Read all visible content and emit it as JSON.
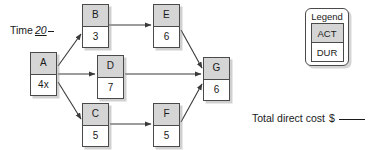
{
  "diagram": {
    "type": "activity-on-node-network",
    "time_annotation": {
      "label": "Time",
      "value": "20"
    },
    "nodes": [
      {
        "id": "A",
        "activity": "A",
        "duration": "4x",
        "x": 30,
        "y": 52
      },
      {
        "id": "B",
        "activity": "B",
        "duration": "3",
        "x": 82,
        "y": 4
      },
      {
        "id": "C",
        "activity": "C",
        "duration": "5",
        "x": 82,
        "y": 103
      },
      {
        "id": "D",
        "activity": "D",
        "duration": "7",
        "x": 97,
        "y": 55
      },
      {
        "id": "E",
        "activity": "E",
        "duration": "6",
        "x": 153,
        "y": 4
      },
      {
        "id": "F",
        "activity": "F",
        "duration": "5",
        "x": 153,
        "y": 103
      },
      {
        "id": "G",
        "activity": "G",
        "duration": "6",
        "x": 203,
        "y": 57
      }
    ],
    "edges": [
      {
        "from": "A",
        "to": "B",
        "x1": 58,
        "y1": 66,
        "x2": 81,
        "y2": 34
      },
      {
        "from": "A",
        "to": "D",
        "x1": 58,
        "y1": 74,
        "x2": 95,
        "y2": 74
      },
      {
        "from": "A",
        "to": "C",
        "x1": 58,
        "y1": 82,
        "x2": 81,
        "y2": 119
      },
      {
        "from": "B",
        "to": "E",
        "x1": 109,
        "y1": 25,
        "x2": 151,
        "y2": 25
      },
      {
        "from": "C",
        "to": "F",
        "x1": 110,
        "y1": 124,
        "x2": 151,
        "y2": 124
      },
      {
        "from": "E",
        "to": "G",
        "x1": 181,
        "y1": 30,
        "x2": 202,
        "y2": 68
      },
      {
        "from": "D",
        "to": "G",
        "x1": 125,
        "y1": 74,
        "x2": 201,
        "y2": 74
      },
      {
        "from": "F",
        "to": "G",
        "x1": 181,
        "y1": 122,
        "x2": 202,
        "y2": 84
      }
    ],
    "colors": {
      "activity_cell_fill": "#d5d5d5",
      "duration_cell_fill": "#ffffff",
      "border": "#4a4a4a",
      "text": "#1a1a1a",
      "background": "#ffffff"
    }
  },
  "legend": {
    "title": "Legend",
    "activity_label": "ACT",
    "duration_label": "DUR"
  },
  "total_cost": {
    "label": "Total direct cost",
    "currency": "$",
    "value": ""
  }
}
